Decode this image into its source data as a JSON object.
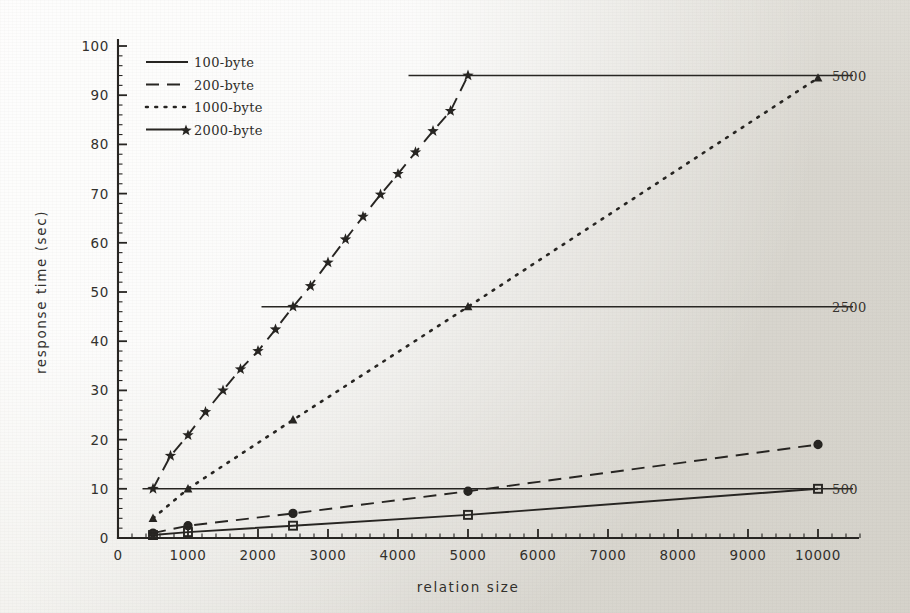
{
  "figure": {
    "background_color": "#efeeea",
    "ink_color": "#262421"
  },
  "chart_data": {
    "type": "line",
    "title": "",
    "xlabel": "relation size",
    "ylabel": "response time (sec)",
    "xlim": [
      0,
      10000
    ],
    "ylim": [
      0,
      100
    ],
    "xticks": [
      0,
      1000,
      2000,
      3000,
      4000,
      5000,
      6000,
      7000,
      8000,
      9000,
      10000
    ],
    "xticklabels": [
      "0",
      "1000",
      "2000",
      "3000",
      "4000",
      "5000",
      "6000",
      "7000",
      "8000",
      "9000",
      "10000"
    ],
    "yticks": [
      0,
      10,
      20,
      30,
      40,
      50,
      60,
      70,
      80,
      90,
      100
    ],
    "yticklabels": [
      "0",
      "10",
      "20",
      "30",
      "40",
      "50",
      "60",
      "70",
      "80",
      "90",
      "100"
    ],
    "minor_ticks": true,
    "grid": false,
    "legend_position": "upper-left",
    "series": [
      {
        "name": "100-byte",
        "linestyle": "solid",
        "marker": "square",
        "x": [
          500,
          1000,
          2500,
          5000,
          10000
        ],
        "y": [
          0.6,
          1.2,
          2.5,
          4.7,
          10.0
        ]
      },
      {
        "name": "200-byte",
        "linestyle": "dashed",
        "marker": "circle",
        "x": [
          500,
          1000,
          2500,
          5000,
          10000
        ],
        "y": [
          1.0,
          2.5,
          5.0,
          9.5,
          19.0
        ]
      },
      {
        "name": "1000-byte",
        "linestyle": "dotted",
        "marker": "triangle",
        "x": [
          500,
          1000,
          2500,
          5000,
          10000
        ],
        "y": [
          4.0,
          10.0,
          24.0,
          47.0,
          93.5
        ]
      },
      {
        "name": "2000-byte",
        "linestyle": "dashed",
        "marker": "star",
        "x": [
          500,
          750,
          1000,
          1250,
          1500,
          1750,
          2000,
          2250,
          2500,
          2750,
          3000,
          3250,
          3500,
          3750,
          4000,
          4250,
          4500,
          4750,
          5000
        ],
        "y": [
          10.0,
          16.7,
          20.9,
          25.6,
          30.0,
          34.3,
          38.0,
          42.4,
          47.0,
          51.2,
          56.0,
          60.7,
          65.3,
          69.8,
          74.0,
          78.4,
          82.7,
          86.8,
          94.0
        ]
      }
    ],
    "reference_lines": [
      {
        "label": "5000",
        "y": 94.0,
        "x_start": 4150,
        "x_end": 10500
      },
      {
        "label": "2500",
        "y": 47.0,
        "x_start": 2050,
        "x_end": 10500
      },
      {
        "label": "500",
        "y": 10.0,
        "x_start": 350,
        "x_end": 10500
      }
    ],
    "legend": [
      {
        "label": "100-byte",
        "linestyle": "solid",
        "marker": "none"
      },
      {
        "label": "200-byte",
        "linestyle": "dashed",
        "marker": "none"
      },
      {
        "label": "1000-byte",
        "linestyle": "dotted",
        "marker": "none"
      },
      {
        "label": "2000-byte",
        "linestyle": "solid",
        "marker": "star"
      }
    ]
  }
}
